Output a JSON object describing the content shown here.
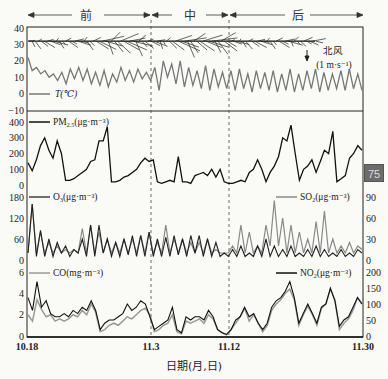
{
  "chart_data": [
    {
      "type": "line",
      "panel": "temperature-wind",
      "periods": [
        "前",
        "中",
        "后"
      ],
      "legend": [
        "T(℃)"
      ],
      "annotation": {
        "label": "北风",
        "scale": "(1 m·s⁻¹)"
      },
      "y_ticks": [
        "40",
        "30",
        "20",
        "10",
        "0",
        "−10"
      ],
      "ylim": [
        -10,
        40
      ],
      "series": [
        {
          "name": "T(℃)",
          "color": "#777777",
          "values": [
            22,
            14,
            16,
            12,
            14,
            10,
            12,
            8,
            13,
            6,
            15,
            9,
            16,
            8,
            15,
            6,
            13,
            5,
            14,
            4,
            12,
            7,
            16,
            8,
            14,
            7,
            15,
            9,
            13,
            8,
            16,
            2,
            20,
            10,
            18,
            6,
            20,
            4,
            16,
            5,
            14,
            3,
            17,
            2,
            15,
            4,
            13,
            3,
            14,
            2,
            15,
            3,
            12,
            1,
            14,
            3,
            13,
            2,
            14,
            1,
            12,
            2,
            15,
            1,
            12,
            2,
            14,
            3,
            15,
            1,
            13,
            2,
            12,
            3,
            14,
            2,
            15,
            3,
            12,
            2
          ]
        }
      ],
      "wind_barbs_y": 32
    },
    {
      "type": "line",
      "panel": "PM2.5",
      "legend": [
        "PM2.5(μg·m⁻³)"
      ],
      "y_ticks": [
        "400",
        "300",
        "200",
        "100",
        "0"
      ],
      "ylim": [
        0,
        400
      ],
      "series": [
        {
          "name": "PM2.5(μg·m⁻³)",
          "color": "#111111",
          "values": [
            140,
            90,
            160,
            250,
            300,
            220,
            170,
            280,
            200,
            30,
            30,
            40,
            60,
            80,
            100,
            150,
            160,
            280,
            280,
            370,
            20,
            20,
            30,
            50,
            60,
            80,
            100,
            140,
            170,
            150,
            160,
            20,
            10,
            20,
            30,
            20,
            180,
            20,
            20,
            10,
            60,
            70,
            80,
            60,
            100,
            50,
            100,
            20,
            10,
            10,
            20,
            30,
            20,
            80,
            100,
            160,
            100,
            20,
            80,
            120,
            180,
            300,
            280,
            380,
            200,
            30,
            100,
            120,
            160,
            80,
            150,
            220,
            200,
            340,
            20,
            40,
            60,
            170,
            200,
            250,
            220
          ]
        }
      ]
    },
    {
      "type": "line",
      "panel": "O3-SO2",
      "legend": [
        "O3(μg·m⁻³)",
        "SO2(μg·m⁻³)"
      ],
      "y_ticks_left": [
        "180",
        "120",
        "60",
        "0"
      ],
      "y_ticks_right": [
        "90",
        "60",
        "30",
        "0"
      ],
      "ylim_left": [
        0,
        180
      ],
      "ylim_right": [
        0,
        90
      ],
      "series": [
        {
          "name": "O3(μg·m⁻³)",
          "color": "#222222",
          "axis": "left",
          "values": [
            20,
            160,
            10,
            85,
            10,
            60,
            10,
            50,
            20,
            40,
            10,
            30,
            20,
            60,
            10,
            100,
            10,
            100,
            20,
            60,
            10,
            50,
            10,
            60,
            15,
            70,
            10,
            70,
            10,
            80,
            10,
            60,
            10,
            65,
            10,
            70,
            15,
            60,
            10,
            70,
            20,
            70,
            10,
            60,
            10,
            50,
            10,
            20,
            10,
            30,
            10,
            40,
            10,
            20,
            10,
            40,
            10,
            60,
            10,
            40,
            10,
            30,
            10,
            40,
            10,
            20,
            10,
            30,
            10,
            40,
            10,
            30,
            10,
            20,
            10,
            30,
            10,
            20,
            10,
            30,
            20
          ]
        },
        {
          "name": "SO2(μg·m⁻³)",
          "color": "#888888",
          "axis": "right",
          "values": [
            10,
            80,
            10,
            40,
            10,
            25,
            10,
            20,
            10,
            15,
            10,
            15,
            10,
            45,
            10,
            50,
            10,
            40,
            10,
            30,
            10,
            25,
            10,
            30,
            10,
            30,
            10,
            35,
            10,
            40,
            10,
            25,
            10,
            50,
            10,
            30,
            10,
            30,
            10,
            25,
            10,
            25,
            10,
            30,
            10,
            15,
            10,
            10,
            10,
            20,
            10,
            50,
            10,
            40,
            10,
            20,
            10,
            50,
            20,
            85,
            20,
            60,
            10,
            50,
            10,
            40,
            10,
            30,
            10,
            55,
            10,
            70,
            10,
            30,
            10,
            20,
            10,
            25,
            10,
            20,
            15
          ]
        }
      ]
    },
    {
      "type": "line",
      "panel": "CO-NO2",
      "legend": [
        "CO(mg·m⁻³)",
        "NO2(μg·m⁻³)"
      ],
      "y_ticks_left": [
        "6",
        "4",
        "2",
        "0"
      ],
      "y_ticks_right": [
        "200",
        "150",
        "100",
        "50",
        "0"
      ],
      "ylim_left": [
        0,
        6
      ],
      "ylim_right": [
        0,
        200
      ],
      "x_ticks": [
        "10.18",
        "11.3",
        "11.12",
        "11.30"
      ],
      "xlabel": "日期(月,日)",
      "series": [
        {
          "name": "CO(mg·m⁻³)",
          "color": "#999999",
          "axis": "left",
          "values": [
            2.0,
            1.4,
            3.4,
            2.5,
            1.8,
            2.0,
            1.4,
            1.6,
            1.4,
            1.6,
            2.0,
            1.8,
            2.4,
            2.0,
            3.0,
            2.2,
            0.4,
            0.6,
            1.0,
            1.2,
            1.0,
            1.4,
            1.8,
            1.6,
            2.0,
            2.4,
            2.6,
            2.0,
            0.4,
            0.6,
            1.0,
            1.2,
            2.0,
            0.4,
            0.2,
            1.4,
            1.2,
            1.4,
            1.6,
            1.2,
            2.0,
            1.6,
            0.6,
            0.3,
            0.1,
            0.6,
            1.2,
            1.8,
            2.6,
            1.4,
            2.0,
            1.2,
            0.4,
            1.0,
            2.4,
            3.0,
            3.4,
            4.0,
            4.4,
            3.4,
            1.0,
            2.0,
            2.8,
            2.0,
            1.0,
            2.6,
            3.0,
            4.4,
            3.4,
            0.6,
            1.2,
            1.6,
            2.4,
            3.6,
            3.0
          ]
        },
        {
          "name": "NO2(μg·m⁻³)",
          "color": "#111111",
          "axis": "right",
          "values": [
            120,
            80,
            170,
            90,
            110,
            70,
            60,
            60,
            70,
            60,
            80,
            70,
            90,
            80,
            110,
            80,
            20,
            40,
            50,
            50,
            60,
            70,
            100,
            80,
            90,
            110,
            100,
            60,
            20,
            30,
            40,
            50,
            90,
            20,
            10,
            60,
            50,
            60,
            60,
            50,
            80,
            60,
            20,
            10,
            5,
            20,
            50,
            60,
            90,
            60,
            70,
            40,
            20,
            40,
            90,
            110,
            120,
            140,
            170,
            120,
            40,
            70,
            100,
            70,
            40,
            90,
            100,
            150,
            110,
            30,
            50,
            60,
            90,
            120,
            100
          ]
        }
      ]
    }
  ],
  "labels": {
    "period_before": "前",
    "period_mid": "中",
    "period_after": "后",
    "temp_legend": "T(℃)",
    "wind_dir": "北风",
    "wind_scale": "(1 m·s⁻¹)",
    "pm_legend": "PM",
    "pm_sub": "2.5",
    "pm_unit": "(μg·m⁻³)",
    "o3_legend": "O",
    "o3_sub": "3",
    "o3_unit": "(μg·m⁻³)",
    "so2_legend": "SO",
    "so2_sub": "2",
    "so2_unit": "(μg·m⁻³)",
    "co_legend": "CO(mg·m⁻³)",
    "no2_legend": "NO",
    "no2_sub": "2",
    "no2_unit": "(μg·m⁻³)",
    "x_title": "日期(月,日)",
    "x_ticks": [
      "10.18",
      "11.3",
      "11.12",
      "11.30"
    ],
    "t_ticks": [
      "40",
      "30",
      "20",
      "10",
      "0",
      "−10"
    ],
    "pm_ticks": [
      "400",
      "300",
      "200",
      "100",
      "0"
    ],
    "o3_ticks": [
      "180",
      "120",
      "60",
      "0"
    ],
    "so2_ticks": [
      "90",
      "60",
      "30",
      "0"
    ],
    "co_ticks": [
      "6",
      "4",
      "2",
      "0"
    ],
    "no2_ticks": [
      "200",
      "150",
      "100",
      "50",
      "0"
    ]
  },
  "badge": {
    "value": "75"
  }
}
